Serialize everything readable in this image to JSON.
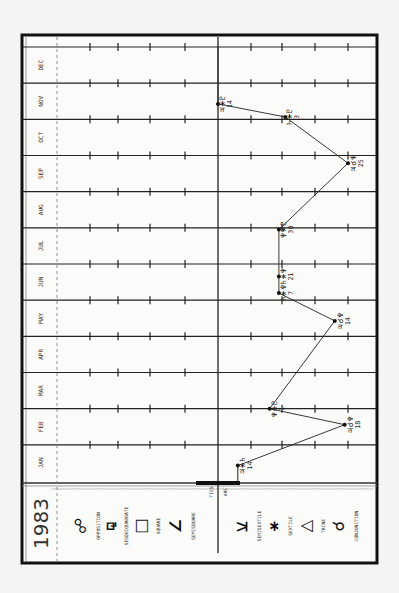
{
  "chart_data": {
    "type": "line",
    "title": "1983",
    "orientation": "rotated-90-ccw",
    "months": [
      "JAN",
      "FEB",
      "MAR",
      "APR",
      "MAY",
      "JUN",
      "JUL",
      "AUG",
      "SEP",
      "OCT",
      "NOV",
      "DEC"
    ],
    "aspects": [
      {
        "key": "opposition",
        "symbol": "☍",
        "label": "OPPOSITION"
      },
      {
        "key": "sesquiquadrate",
        "symbol": "⚼",
        "label": "SESQUIQUADRATE"
      },
      {
        "key": "square",
        "symbol": "□",
        "label": "SQUARE"
      },
      {
        "key": "semisquare",
        "symbol": "∠",
        "label": "SEMISQUARE"
      },
      {
        "key": "semisextile",
        "symbol": "⚺",
        "label": "SEMISEXTILE"
      },
      {
        "key": "sextile",
        "symbol": "⚹",
        "label": "SEXTILE"
      },
      {
        "key": "trine",
        "symbol": "△",
        "label": "TRINE"
      },
      {
        "key": "conjunction",
        "symbol": "☌",
        "label": "CONJUNCTION"
      }
    ],
    "divider_labels": [
      "TIES",
      "ARE"
    ],
    "series": [
      {
        "name": "aspect path",
        "points": [
          {
            "month": 1,
            "day": 14,
            "aspect_pos": 4.6,
            "label": "♃⚹♄",
            "day_label": "14"
          },
          {
            "month": 2,
            "day": 18,
            "aspect_pos": 7.9,
            "label": "♃☌♆",
            "day_label": "18"
          },
          {
            "month": 3,
            "day": 1,
            "aspect_pos": 5.6,
            "label": "♆⚹♇",
            "day_label": "1"
          },
          {
            "month": 5,
            "day": 14,
            "aspect_pos": 7.6,
            "label": "♃☌♆",
            "day_label": "14"
          },
          {
            "month": 6,
            "day": 7,
            "aspect_pos": 5.9,
            "label": "♄⚹♆",
            "day_label": "7"
          },
          {
            "month": 6,
            "day": 21,
            "aspect_pos": 5.9,
            "label": "♄⚹♆",
            "day_label": "21"
          },
          {
            "month": 7,
            "day": 30,
            "aspect_pos": 5.9,
            "label": "♆⚹♇",
            "day_label": "30"
          },
          {
            "month": 9,
            "day": 25,
            "aspect_pos": 8.0,
            "label": "♃☌♆",
            "day_label": "25"
          },
          {
            "month": 11,
            "day": 3,
            "aspect_pos": 6.1,
            "label": "♄⚹♇",
            "day_label": "3"
          },
          {
            "month": 11,
            "day": 14,
            "aspect_pos": 4.0,
            "label": "♃⚹♇",
            "day_label": "14"
          }
        ]
      }
    ],
    "tail_to": {
      "month": 12,
      "day": 31,
      "aspect_pos": 4.0
    }
  }
}
